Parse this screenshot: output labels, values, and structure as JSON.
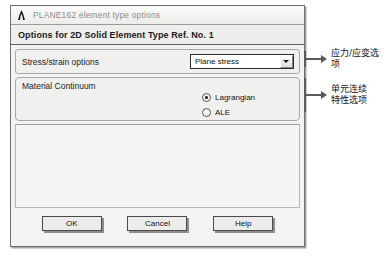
{
  "dialog": {
    "titlebar": {
      "icon": "ansys-a-logo-icon",
      "title": "PLANE162 element type options"
    },
    "subtitle": "Options for 2D Solid Element Type Ref. No. 1",
    "stress_strain": {
      "label": "Stress/strain options",
      "combo_value": "Plane stress",
      "combo_arrow_icon": "chevron-down-icon"
    },
    "material_continuum": {
      "title": "Material Continuum",
      "options": [
        {
          "label": "Lagrangian",
          "checked": true
        },
        {
          "label": "ALE",
          "checked": false
        }
      ]
    },
    "buttons": [
      {
        "label": "OK"
      },
      {
        "label": "Cancel"
      },
      {
        "label": "Help"
      }
    ]
  },
  "annotations": [
    {
      "text": "应力/应变选项"
    },
    {
      "text": "单元连续\n特性选项"
    }
  ]
}
